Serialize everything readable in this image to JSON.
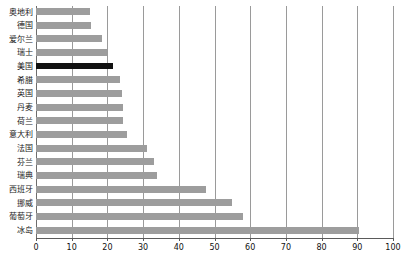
{
  "chart_data": {
    "type": "bar",
    "orientation": "horizontal",
    "title": "",
    "xlabel": "",
    "ylabel": "",
    "xlim": [
      0,
      100
    ],
    "xticks": [
      0,
      10,
      20,
      30,
      40,
      50,
      60,
      70,
      80,
      90,
      100
    ],
    "grid": true,
    "legend": "none",
    "categories": [
      "奥地利",
      "德国",
      "爱尔兰",
      "瑞士",
      "美国",
      "希腊",
      "英国",
      "丹麦",
      "荷兰",
      "意大利",
      "法国",
      "芬兰",
      "瑞典",
      "西班牙",
      "挪威",
      "葡萄牙",
      "冰岛"
    ],
    "values": [
      15,
      15.5,
      18.5,
      20,
      21.5,
      23.5,
      24,
      24.5,
      24.5,
      25.5,
      31,
      33,
      34,
      47.5,
      55,
      58,
      90.5
    ],
    "highlight_category": "美国",
    "colors": {
      "bar": "#9d9d9d",
      "highlight": "#111111",
      "gridline": "#9a9a9a",
      "axis": "#5a5a5a",
      "background": "#ffffff"
    }
  }
}
